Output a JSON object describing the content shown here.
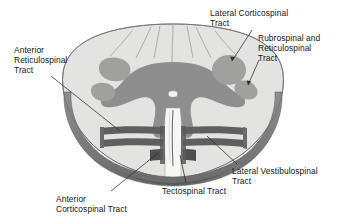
{
  "figure": {
    "view": "transverse section",
    "background_color": "#ffffff"
  },
  "colors": {
    "white_matter": "#e3e3e1",
    "gray_matter": "#8e8e8e",
    "tract_highlight": "#a0a09e",
    "ventral_rim_dark": "#6e6e6e",
    "band_dark": "#5f5f5f",
    "outline": "#5a5a5a",
    "leader_line": "#2b2b2b",
    "text": "#151515"
  },
  "labels": {
    "lateral_corticospinal": "Lateral Corticospinal\nTract",
    "rubrospinal_reticulospinal": "Rubrospinal and\nReticulospinal\nTract",
    "anterior_reticulospinal": "Anterior\nReticulospinal\nTract",
    "lateral_vestibulospinal": "Lateral Vestibulospinal\nTract",
    "tectospinal": "Tectospinal Tract",
    "anterior_corticospinal": "Anterior\nCorticospinal Tract"
  },
  "structures": [
    {
      "name": "lateral-corticospinal-tract",
      "label": "Lateral Corticospinal Tract",
      "side": "right",
      "shape": "large round blob",
      "position": "dorsolateral white matter"
    },
    {
      "name": "rubrospinal-and-reticulospinal-tract",
      "label": "Rubrospinal and Reticulospinal Tract",
      "side": "right",
      "shape": "small oval",
      "position": "lateral white matter, below lateral corticospinal"
    },
    {
      "name": "anterior-reticulospinal-tract",
      "label": "Anterior Reticulospinal Tract",
      "side": "left",
      "shape": "two adjacent blobs",
      "position": "lateral / anterolateral white matter"
    },
    {
      "name": "lateral-vestibulospinal-tract",
      "label": "Lateral Vestibulospinal Tract",
      "side": "right",
      "shape": "horizontal band",
      "position": "anterior funiculus"
    },
    {
      "name": "tectospinal-tract",
      "label": "Tectospinal Tract",
      "side": "center-right",
      "shape": "narrow band near anterior median fissure",
      "position": "anterior funiculus, paramedian"
    },
    {
      "name": "anterior-corticospinal-tract",
      "label": "Anterior Corticospinal Tract",
      "side": "center-left",
      "shape": "narrow band flanking anterior median fissure",
      "position": "anterior funiculus, paramedian"
    },
    {
      "name": "central-canal",
      "label": "central canal",
      "side": "center",
      "shape": "small white oval",
      "position": "center of gray commissure"
    },
    {
      "name": "anterior-median-fissure",
      "label": "anterior median fissure",
      "side": "center",
      "shape": "vertical cleft",
      "position": "ventral midline"
    }
  ]
}
